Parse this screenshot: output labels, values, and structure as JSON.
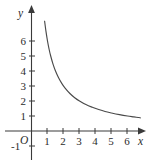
{
  "chart_data": {
    "type": "line",
    "title": "",
    "subtitle": "",
    "xlabel": "x",
    "ylabel": "y",
    "origin_label": "O",
    "xlim": [
      -0.55,
      7.6
    ],
    "ylim": [
      -1.45,
      7.9
    ],
    "grid": false,
    "legend": null,
    "x_ticks": [
      1,
      2,
      3,
      4,
      5,
      6
    ],
    "x_tick_labels": [
      "1",
      "2",
      "3",
      "4",
      "5",
      "6"
    ],
    "y_ticks": [
      -1,
      1,
      2,
      3,
      4,
      5,
      6
    ],
    "y_tick_labels": [
      "-1",
      "1",
      "2",
      "3",
      "4",
      "5",
      "6"
    ],
    "axis_arrows": [
      "x-positive",
      "y-positive"
    ],
    "series": [
      {
        "name": "curve",
        "relation": "y = 6 / x",
        "x": [
          0.82,
          0.9,
          1.0,
          1.1,
          1.2,
          1.35,
          1.5,
          1.7,
          1.9,
          2.1,
          2.4,
          2.7,
          3.0,
          3.4,
          3.8,
          4.2,
          4.6,
          5.0,
          5.5,
          6.0,
          6.4,
          6.8
        ],
        "y": [
          7.32,
          6.67,
          6.0,
          5.45,
          5.0,
          4.44,
          4.0,
          3.53,
          3.16,
          2.86,
          2.5,
          2.22,
          2.0,
          1.76,
          1.58,
          1.43,
          1.3,
          1.2,
          1.09,
          1.0,
          0.94,
          0.88
        ]
      }
    ],
    "colors": {
      "axis": "#3a3a3a",
      "curve": "#4a4a4a",
      "text": "#2b2b2b",
      "background": "#ffffff"
    }
  }
}
